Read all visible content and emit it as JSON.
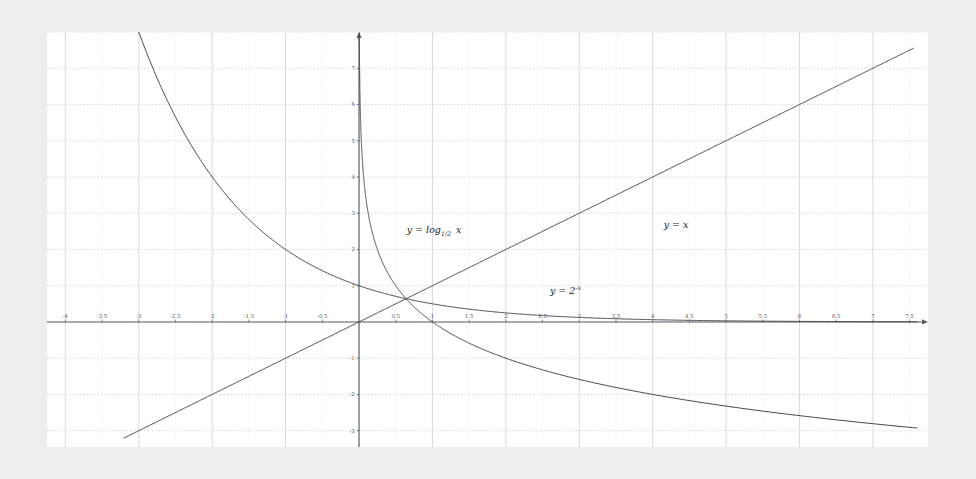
{
  "figure": {
    "background_color": "#eeeeee",
    "plot_background_color": "#ffffff",
    "grid_color": "#c8ccd4",
    "minor_grid_color": "#e2e5ea",
    "axis_color": "#5a6068",
    "curve_color": "#3c3c3c",
    "label_color": "#555a60"
  },
  "chart_data": {
    "type": "line",
    "title": "",
    "xlabel": "",
    "ylabel": "",
    "xlim": [
      -4.25,
      7.75
    ],
    "ylim": [
      -3.45,
      8.0
    ],
    "grid": true,
    "grid_major_step_x": 0.5,
    "grid_major_step_y": 1,
    "legend_position": "inline-annotations",
    "x_tick_labels": [
      "-4",
      "-3.5",
      "-3",
      "-2.5",
      "-2",
      "-1.5",
      "-1",
      "-0.5",
      "0.5",
      "1",
      "1.5",
      "2",
      "2.5",
      "3",
      "3.5",
      "4",
      "4.5",
      "5",
      "5.5",
      "6",
      "6.5",
      "7",
      "7.5"
    ],
    "x_tick_values": [
      -4,
      -3.5,
      -3,
      -2.5,
      -2,
      -1.5,
      -1,
      -0.5,
      0.5,
      1,
      1.5,
      2,
      2.5,
      3,
      3.5,
      4,
      4.5,
      5,
      5.5,
      6,
      6.5,
      7,
      7.5
    ],
    "y_tick_labels": [
      "-3",
      "-2",
      "-1",
      "1",
      "2",
      "3",
      "4",
      "5",
      "6",
      "7"
    ],
    "y_tick_values": [
      -3,
      -2,
      -1,
      1,
      2,
      3,
      4,
      5,
      6,
      7
    ],
    "series": [
      {
        "name": "y = log_{1/2} x",
        "label_text": "y = log",
        "label_sub": "1/2",
        "label_var": "x",
        "fn": "log_half",
        "x_start": 0.004,
        "x_end": 7.6,
        "label_x": 0.65,
        "label_y": 2.45,
        "x": [
          0.004,
          0.006,
          0.01,
          0.02,
          0.03,
          0.05,
          0.08,
          0.12,
          0.18,
          0.25,
          0.35,
          0.5,
          0.7,
          1.0,
          1.4,
          2.0,
          2.8,
          4.0,
          5.5,
          7.5
        ],
        "y": [
          7.97,
          7.38,
          6.64,
          5.64,
          5.06,
          4.32,
          3.64,
          3.06,
          2.47,
          2.0,
          1.51,
          1.0,
          0.51,
          0.0,
          -0.49,
          -1.0,
          -1.49,
          -2.0,
          -2.46,
          -2.91
        ]
      },
      {
        "name": "y = x",
        "label_text": "y = x",
        "fn": "identity",
        "x_start": -3.2,
        "x_end": 7.55,
        "label_x": 4.15,
        "label_y": 2.6,
        "x": [
          -3.2,
          0,
          7.55
        ],
        "y": [
          -3.2,
          0,
          7.55
        ]
      },
      {
        "name": "y = 2^{-x}",
        "label_text": "y = 2",
        "label_sup": "-x",
        "fn": "two_pow_neg_x",
        "x_start": -3.0,
        "x_end": 7.6,
        "label_x": 2.6,
        "label_y": 0.78,
        "x": [
          -3.0,
          -2.5,
          -2.0,
          -1.5,
          -1.0,
          -0.5,
          0,
          0.5,
          1.0,
          1.5,
          2.0,
          3.0,
          4.0,
          5.0,
          6.0,
          7.5
        ],
        "y": [
          8.0,
          5.66,
          4.0,
          2.83,
          2.0,
          1.41,
          1.0,
          0.71,
          0.5,
          0.354,
          0.25,
          0.125,
          0.0625,
          0.031,
          0.016,
          0.0055
        ]
      }
    ],
    "annotations": [
      {
        "text": "y = log₁ᐟ₂ x",
        "x": 0.65,
        "y": 2.45
      },
      {
        "text": "y = x",
        "x": 4.15,
        "y": 2.6
      },
      {
        "text": "y = 2⁻ˣ",
        "x": 2.6,
        "y": 0.78
      }
    ]
  }
}
